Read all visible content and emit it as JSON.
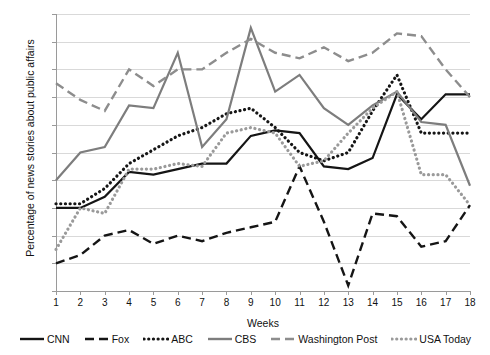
{
  "chart_data": {
    "type": "line",
    "title": "",
    "xlabel": "Weeks",
    "ylabel": "Percentage of news stories about public affairs",
    "x": [
      1,
      2,
      3,
      4,
      5,
      6,
      7,
      8,
      9,
      10,
      11,
      12,
      13,
      14,
      15,
      16,
      17,
      18
    ],
    "xlim": [
      1,
      18
    ],
    "ylim": [
      0,
      100
    ],
    "grid": true,
    "legend_position": "bottom",
    "ytick_labels": [
      "0%",
      "10%",
      "20%",
      "30%",
      "40%",
      "50%",
      "60%",
      "70%",
      "80%",
      "90%",
      "100%"
    ],
    "ytick_values": [
      0,
      10,
      20,
      30,
      40,
      50,
      60,
      70,
      80,
      90,
      100
    ],
    "xtick_labels": [
      "1",
      "2",
      "3",
      "4",
      "5",
      "6",
      "7",
      "8",
      "9",
      "10",
      "11",
      "12",
      "13",
      "14",
      "15",
      "16",
      "17",
      "18"
    ],
    "series": [
      {
        "name": "CNN",
        "style": "solid",
        "color": "#151515",
        "values": [
          30,
          30,
          34,
          43,
          42,
          44,
          46,
          46,
          56,
          58,
          57,
          45,
          44,
          48,
          71,
          62,
          71,
          71
        ]
      },
      {
        "name": "Fox",
        "style": "dashed",
        "color": "#151515",
        "values": [
          10,
          13,
          20,
          22,
          17,
          20,
          18,
          21,
          23,
          25,
          45,
          25,
          2,
          28,
          27,
          16,
          18,
          31
        ]
      },
      {
        "name": "ABC",
        "style": "dotted",
        "color": "#151515",
        "values": [
          31.5,
          31.5,
          37,
          46,
          51,
          56,
          59,
          64,
          66,
          59,
          50,
          47,
          50,
          65,
          78,
          57,
          57,
          57
        ]
      },
      {
        "name": "CBS",
        "style": "solid",
        "color": "#7d7d7d",
        "values": [
          40,
          50,
          52,
          67,
          66,
          86,
          52,
          62,
          95,
          72,
          78,
          66,
          60,
          67,
          72,
          61,
          60,
          38
        ]
      },
      {
        "name": "Washington Post",
        "style": "dashed",
        "color": "#8d8d8d",
        "values": [
          75,
          69,
          65,
          80,
          74,
          80,
          80,
          86,
          91,
          86,
          84,
          88,
          83,
          86,
          93,
          92,
          80,
          70
        ]
      },
      {
        "name": "USA Today",
        "style": "dotted",
        "color": "#9a9a9a",
        "values": [
          15,
          30,
          28,
          44,
          44,
          46,
          45,
          57,
          59,
          57,
          45,
          47,
          57,
          66,
          72,
          42,
          42,
          31
        ]
      }
    ]
  },
  "legend": {
    "items": [
      {
        "label": "CNN"
      },
      {
        "label": "Fox"
      },
      {
        "label": "ABC"
      },
      {
        "label": "CBS"
      },
      {
        "label": "Washington Post"
      },
      {
        "label": "USA Today"
      }
    ]
  }
}
